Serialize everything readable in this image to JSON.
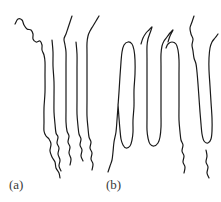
{
  "figure": {
    "width": 221,
    "height": 202,
    "background_color": "#ffffff",
    "stroke_color": "#1a1a1a",
    "stroke_width": 1.2,
    "label_color": "#3a3a3a"
  },
  "panels": [
    {
      "id": "a",
      "label": "(a)",
      "description": "extended chain strands with wiggly free ends",
      "strand_count": 5
    },
    {
      "id": "b",
      "label": "(b)",
      "description": "chain-folded strands with hairpin turns at top and bottom",
      "strand_count": 4,
      "top_folds": 3,
      "bottom_folds": 3
    }
  ],
  "chart_data": {
    "type": "line",
    "xlabel": "",
    "ylabel": "",
    "xlim": [
      0,
      221
    ],
    "ylim": [
      0,
      202
    ],
    "grid": false,
    "legend": "none",
    "annotations": [
      {
        "text": "(a)",
        "x": 9,
        "y": 178
      },
      {
        "text": "(b)",
        "x": 106,
        "y": 178
      }
    ],
    "series": [
      {
        "name": "a-strand-1",
        "panel": "a",
        "points": [
          [
            15,
            24
          ],
          [
            18,
            19
          ],
          [
            22,
            20
          ],
          [
            24,
            25
          ],
          [
            27,
            29
          ],
          [
            31,
            30
          ],
          [
            33,
            34
          ],
          [
            33,
            39
          ],
          [
            36,
            42
          ],
          [
            40,
            41
          ],
          [
            42,
            45
          ],
          [
            42,
            50
          ],
          [
            44,
            55
          ],
          [
            45,
            62
          ],
          [
            45,
            75
          ],
          [
            45,
            92
          ],
          [
            44,
            108
          ],
          [
            44,
            122
          ],
          [
            44,
            131
          ],
          [
            46,
            136
          ],
          [
            49,
            139
          ],
          [
            51,
            144
          ],
          [
            50,
            151
          ],
          [
            52,
            157
          ],
          [
            55,
            162
          ],
          [
            56,
            168
          ],
          [
            59,
            173
          ],
          [
            60,
            178
          ]
        ]
      },
      {
        "name": "a-strand-2",
        "panel": "a",
        "points": [
          [
            52,
            40
          ],
          [
            53,
            52
          ],
          [
            53,
            66
          ],
          [
            54,
            82
          ],
          [
            54,
            98
          ],
          [
            54,
            112
          ],
          [
            55,
            124
          ],
          [
            56,
            133
          ],
          [
            58,
            137
          ],
          [
            57,
            143
          ],
          [
            59,
            148
          ],
          [
            58,
            154
          ],
          [
            60,
            160
          ],
          [
            59,
            166
          ],
          [
            61,
            171
          ]
        ]
      },
      {
        "name": "a-strand-3",
        "panel": "a",
        "points": [
          [
            72,
            16
          ],
          [
            70,
            22
          ],
          [
            68,
            28
          ],
          [
            66,
            34
          ],
          [
            64,
            39
          ],
          [
            65,
            45
          ],
          [
            66,
            52
          ],
          [
            66,
            64
          ],
          [
            66,
            78
          ],
          [
            66,
            94
          ],
          [
            66,
            110
          ],
          [
            66,
            122
          ],
          [
            67,
            131
          ],
          [
            69,
            136
          ],
          [
            68,
            142
          ],
          [
            70,
            147
          ],
          [
            69,
            153
          ],
          [
            71,
            159
          ],
          [
            70,
            165
          ]
        ]
      },
      {
        "name": "a-strand-4",
        "panel": "a",
        "points": [
          [
            76,
            42
          ],
          [
            77,
            54
          ],
          [
            77,
            68
          ],
          [
            77,
            84
          ],
          [
            77,
            100
          ],
          [
            77,
            114
          ],
          [
            78,
            126
          ],
          [
            79,
            134
          ],
          [
            81,
            139
          ],
          [
            80,
            145
          ],
          [
            82,
            150
          ],
          [
            81,
            156
          ],
          [
            83,
            161
          ]
        ]
      },
      {
        "name": "a-strand-5",
        "panel": "a",
        "points": [
          [
            99,
            16
          ],
          [
            96,
            21
          ],
          [
            93,
            26
          ],
          [
            90,
            31
          ],
          [
            88,
            36
          ],
          [
            87,
            43
          ],
          [
            87,
            54
          ],
          [
            87,
            68
          ],
          [
            87,
            84
          ],
          [
            87,
            100
          ],
          [
            87,
            116
          ],
          [
            88,
            128
          ],
          [
            89,
            137
          ],
          [
            91,
            142
          ],
          [
            90,
            148
          ],
          [
            92,
            153
          ],
          [
            91,
            159
          ],
          [
            93,
            164
          ],
          [
            92,
            170
          ]
        ]
      },
      {
        "name": "b-strand-1",
        "panel": "b",
        "points": [
          [
            108,
            172
          ],
          [
            110,
            166
          ],
          [
            112,
            160
          ],
          [
            113,
            152
          ],
          [
            114,
            142
          ],
          [
            116,
            132
          ],
          [
            117,
            120
          ],
          [
            118,
            106
          ],
          [
            119,
            92
          ],
          [
            120,
            76
          ],
          [
            121,
            62
          ],
          [
            122,
            52
          ],
          [
            124,
            45
          ],
          [
            128,
            42
          ],
          [
            132,
            44
          ],
          [
            134,
            50
          ],
          [
            135,
            60
          ],
          [
            135,
            74
          ],
          [
            134,
            90
          ],
          [
            134,
            106
          ],
          [
            133,
            120
          ],
          [
            133,
            132
          ],
          [
            132,
            140
          ],
          [
            130,
            146
          ],
          [
            126,
            148
          ],
          [
            123,
            145
          ],
          [
            121,
            139
          ],
          [
            120,
            130
          ],
          [
            119,
            118
          ],
          [
            118,
            104
          ]
        ]
      },
      {
        "name": "b-strand-2",
        "panel": "b",
        "points": [
          [
            141,
            44
          ],
          [
            143,
            38
          ],
          [
            146,
            33
          ],
          [
            149,
            30
          ],
          [
            152,
            27
          ],
          [
            150,
            33
          ],
          [
            148,
            39
          ],
          [
            147,
            46
          ],
          [
            147,
            58
          ],
          [
            147,
            72
          ],
          [
            147,
            88
          ],
          [
            147,
            104
          ],
          [
            147,
            118
          ],
          [
            147,
            130
          ],
          [
            148,
            138
          ],
          [
            150,
            144
          ],
          [
            154,
            146
          ],
          [
            158,
            143
          ],
          [
            160,
            137
          ],
          [
            161,
            127
          ],
          [
            161,
            113
          ],
          [
            161,
            98
          ],
          [
            161,
            82
          ],
          [
            161,
            66
          ],
          [
            161,
            54
          ],
          [
            162,
            46
          ],
          [
            164,
            41
          ],
          [
            167,
            37
          ],
          [
            170,
            33
          ],
          [
            173,
            30
          ],
          [
            170,
            36
          ],
          [
            168,
            42
          ]
        ]
      },
      {
        "name": "b-strand-3",
        "panel": "b",
        "points": [
          [
            166,
            48
          ],
          [
            168,
            44
          ],
          [
            172,
            42
          ],
          [
            176,
            44
          ],
          [
            178,
            50
          ],
          [
            179,
            60
          ],
          [
            179,
            74
          ],
          [
            179,
            90
          ],
          [
            179,
            106
          ],
          [
            179,
            120
          ],
          [
            180,
            132
          ],
          [
            181,
            140
          ],
          [
            183,
            145
          ],
          [
            182,
            151
          ],
          [
            184,
            156
          ],
          [
            183,
            162
          ],
          [
            185,
            167
          ],
          [
            184,
            173
          ]
        ]
      },
      {
        "name": "b-strand-4",
        "panel": "b",
        "points": [
          [
            194,
            16
          ],
          [
            192,
            22
          ],
          [
            190,
            28
          ],
          [
            191,
            34
          ],
          [
            193,
            39
          ],
          [
            192,
            45
          ],
          [
            193,
            51
          ],
          [
            194,
            58
          ],
          [
            196,
            64
          ],
          [
            197,
            72
          ],
          [
            198,
            84
          ],
          [
            199,
            98
          ],
          [
            200,
            112
          ],
          [
            201,
            124
          ],
          [
            202,
            134
          ],
          [
            204,
            141
          ],
          [
            208,
            143
          ],
          [
            211,
            139
          ],
          [
            212,
            131
          ],
          [
            212,
            118
          ],
          [
            211,
            102
          ],
          [
            210,
            86
          ],
          [
            209,
            70
          ],
          [
            209,
            58
          ],
          [
            210,
            48
          ],
          [
            212,
            42
          ],
          [
            215,
            38
          ],
          [
            218,
            34
          ]
        ]
      },
      {
        "name": "b-strand-5",
        "panel": "b",
        "points": [
          [
            206,
            150
          ],
          [
            207,
            156
          ],
          [
            206,
            162
          ],
          [
            208,
            167
          ],
          [
            207,
            173
          ],
          [
            209,
            178
          ]
        ]
      }
    ]
  }
}
